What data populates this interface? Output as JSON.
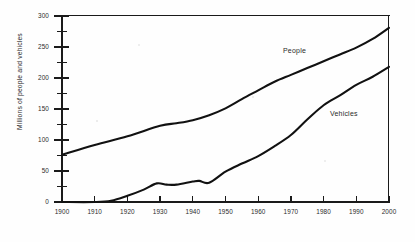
{
  "chart_data": {
    "type": "line",
    "title": "",
    "xlabel": "",
    "ylabel": "Millions of people and vehicles",
    "xlim": [
      1900,
      2000
    ],
    "ylim": [
      0,
      300
    ],
    "xticks": [
      1900,
      1910,
      1920,
      1930,
      1940,
      1950,
      1960,
      1970,
      1980,
      1990,
      2000
    ],
    "yticks": [
      0,
      50,
      100,
      150,
      200,
      250,
      300
    ],
    "yticks_minor": [
      25,
      75,
      125,
      175,
      225,
      275
    ],
    "grid": false,
    "legend_position": "inline-annotations",
    "series": [
      {
        "name": "People",
        "label_text": "People",
        "x": [
          1900,
          1910,
          1920,
          1930,
          1935,
          1940,
          1945,
          1950,
          1955,
          1960,
          1965,
          1970,
          1975,
          1980,
          1985,
          1990,
          1995,
          2000
        ],
        "values": [
          76,
          92,
          106,
          123,
          127,
          132,
          140,
          151,
          166,
          180,
          194,
          205,
          216,
          227,
          238,
          249,
          263,
          281
        ]
      },
      {
        "name": "Vehicles",
        "label_text": "Vehicles",
        "x": [
          1900,
          1910,
          1915,
          1920,
          1925,
          1929,
          1932,
          1935,
          1940,
          1942,
          1945,
          1950,
          1955,
          1960,
          1965,
          1970,
          1975,
          1980,
          1985,
          1990,
          1995,
          2000
        ],
        "values": [
          0,
          0,
          2,
          10,
          20,
          30,
          28,
          28,
          33,
          34,
          31,
          49,
          62,
          74,
          90,
          108,
          133,
          156,
          172,
          189,
          202,
          218
        ]
      }
    ]
  },
  "axis": {
    "y_title": "Millions of people and vehicles",
    "y_tick_labels": [
      "300",
      "250",
      "200",
      "150",
      "100",
      "50",
      "0"
    ],
    "x_tick_labels": [
      "1900",
      "1910",
      "1920",
      "1930",
      "1940",
      "1950",
      "1960",
      "1970",
      "1980",
      "1990",
      "2000"
    ]
  },
  "annotations": {
    "people": "People",
    "vehicles": "Vehicles"
  },
  "colors": {
    "line": "#111111",
    "axis": "#1a1a1a",
    "text": "#2a2a2a",
    "background": "#ffffff"
  }
}
